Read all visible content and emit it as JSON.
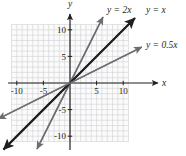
{
  "figure": {
    "background_color": "#ffffff",
    "axis_color": "#231f20",
    "grid_color": "#cfd0d2",
    "grid_fill": "#fbfbfc"
  },
  "chart_data": {
    "type": "line",
    "title": "",
    "subtitle": "",
    "xlabel": "x",
    "ylabel": "y",
    "xlim": [
      -12,
      12
    ],
    "ylim": [
      -12,
      12
    ],
    "grid": true,
    "grid_range": [
      -11,
      11
    ],
    "grid_step": 1,
    "legend": "inline-labels",
    "x_tick_labels": [
      "-10",
      "-5",
      "5",
      "10"
    ],
    "x_tick_values": [
      -10,
      -5,
      5,
      10
    ],
    "y_tick_labels": [
      "10",
      "5",
      "-5",
      "-10"
    ],
    "y_tick_values": [
      10,
      5,
      -5,
      -10
    ],
    "series": [
      {
        "name": "y = 2x",
        "label": "y = 2x",
        "slope": 2,
        "intercept": 0,
        "color": "#6d6e71",
        "width": 1.5,
        "x_from": -6.2,
        "x_to": 6.2,
        "label_x": 107,
        "label_y": 13
      },
      {
        "name": "y = x",
        "label": "y = x",
        "slope": 1,
        "intercept": 0,
        "color": "#231f20",
        "width": 2.0,
        "x_from": -12.5,
        "x_to": 12.2,
        "label_x": 146,
        "label_y": 13
      },
      {
        "name": "y = 0.5x",
        "label": "y = 0.5x",
        "slope": 0.5,
        "intercept": 0,
        "color": "#6d6e71",
        "width": 1.5,
        "x_from": -13.5,
        "x_to": 13.5,
        "label_x": 146,
        "label_y": 48
      }
    ],
    "annotations": [
      {
        "text": "y",
        "x": 70,
        "y": 7,
        "role": "y-axis-name"
      },
      {
        "text": "x",
        "x": 164,
        "y": 86,
        "role": "x-axis-name"
      }
    ]
  }
}
